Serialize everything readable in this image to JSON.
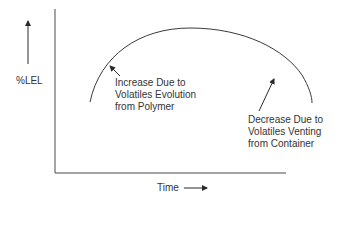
{
  "diagram": {
    "type": "concept-curve",
    "axes": {
      "y_label": "%LEL",
      "x_label": "Time"
    },
    "annotations": {
      "increase": {
        "lines": [
          "Increase Due to",
          "Volatiles Evolution",
          "from Polymer"
        ]
      },
      "decrease": {
        "lines": [
          "Decrease Due to",
          "Volatiles Venting",
          "from Container"
        ]
      }
    },
    "colors": {
      "line": "#3a3a3a",
      "text": "#333333",
      "background": "#ffffff"
    }
  }
}
